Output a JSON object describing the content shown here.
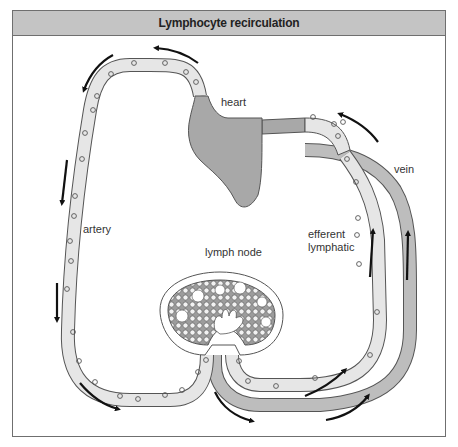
{
  "figure": {
    "title": "Lymphocyte recirculation",
    "labels": {
      "heart": "heart",
      "artery": "artery",
      "lymph_node": "lymph node",
      "efferent_lymphatic_1": "efferent",
      "efferent_lymphatic_2": "lymphatic",
      "vein": "vein"
    },
    "colors": {
      "header_bg": "#c4c4c4",
      "artery_fill": "#e6e6e6",
      "vein_fill": "#bdbdbd",
      "heart_fill": "#a8a8a8",
      "node_fill": "#9c9c9c",
      "outline": "#555555",
      "arrow": "#111111"
    }
  }
}
